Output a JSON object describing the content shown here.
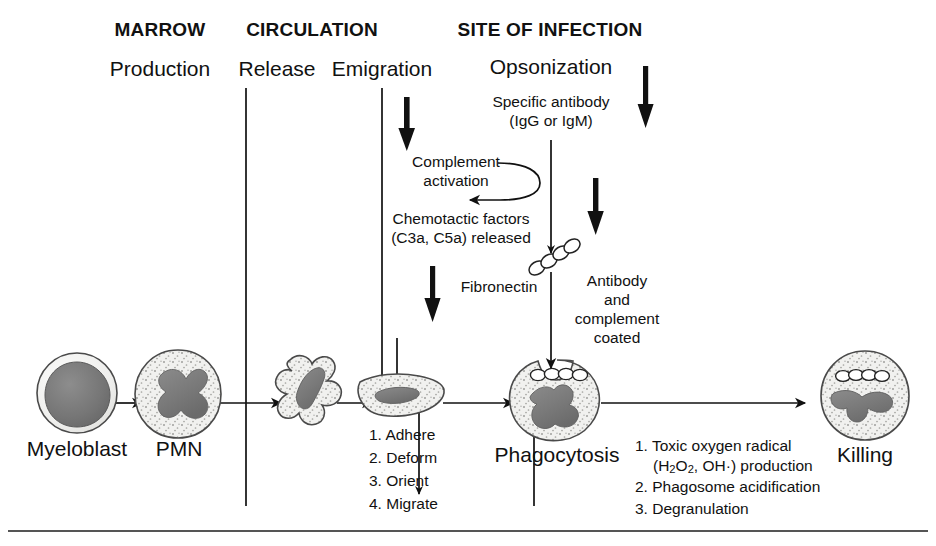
{
  "figure": {
    "ink_color": "#111111",
    "cytoplasm_color": "#f1f1ef",
    "nucleus_color": "#7d7d7d",
    "membrane_color": "#4a4a4a"
  },
  "sections": [
    {
      "id": "marrow",
      "label": "MARROW"
    },
    {
      "id": "circulation",
      "label": "CIRCULATION"
    },
    {
      "id": "site",
      "label": "SITE OF INFECTION"
    }
  ],
  "stages": [
    {
      "id": "production",
      "label": "Production"
    },
    {
      "id": "release",
      "label": "Release"
    },
    {
      "id": "emigration",
      "label": "Emigration"
    },
    {
      "id": "opsonization",
      "label": "Opsonization"
    }
  ],
  "cells": [
    {
      "id": "myeloblast",
      "label": "Myeloblast"
    },
    {
      "id": "pmn",
      "label": "PMN"
    },
    {
      "id": "phagocytosis",
      "label": "Phagocytosis"
    },
    {
      "id": "killing",
      "label": "Killing"
    }
  ],
  "annotations": {
    "specific_antibody": {
      "line1": "Specific antibody",
      "line2": "(IgG or IgM)"
    },
    "complement": {
      "line1": "Complement",
      "line2": "activation"
    },
    "chemotactic": {
      "line1": "Chemotactic factors",
      "line2": "(C3a, C5a) released"
    },
    "fibronectin": "Fibronectin",
    "coated": {
      "line1": "Antibody",
      "line2": "and",
      "line3": "complement",
      "line4": "coated"
    }
  },
  "emigration_steps": [
    "1. Adhere",
    "2. Deform",
    "3. Orient",
    "4. Migrate"
  ],
  "killing_steps": {
    "item1_a": "1. Toxic oxygen radical",
    "item1_b_pre": "(H",
    "item1_b_sub1": "2",
    "item1_b_mid": "O",
    "item1_b_sub2": "2",
    "item1_b_post": ", OH·) production",
    "item2": "2. Phagosome acidification",
    "item3": "3. Degranulation"
  }
}
